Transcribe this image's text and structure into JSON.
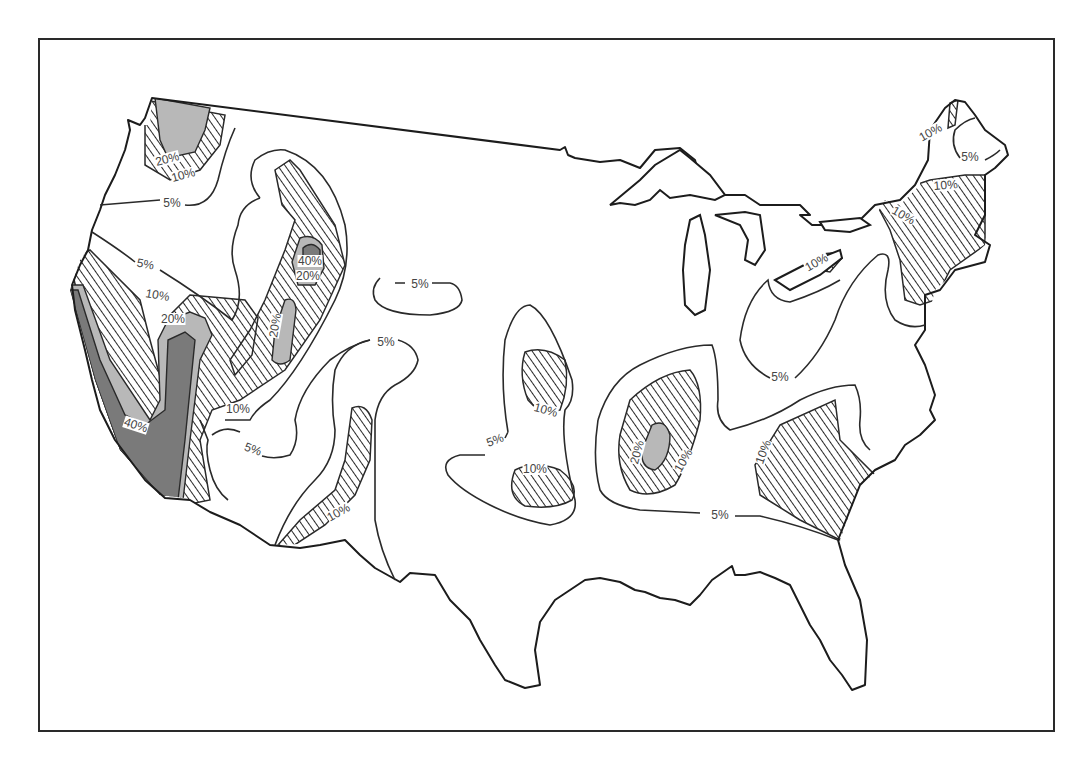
{
  "map": {
    "region": "Contiguous United States",
    "colors": {
      "outline": "#1c1c1c",
      "hatch": "#2a2a2a",
      "light_grey": "#b8b8b8",
      "dark_grey": "#7a7a7a",
      "background": "#ffffff"
    },
    "legend_implied": [
      {
        "range": "< 10%",
        "fill": "white"
      },
      {
        "range": "10% - 20%",
        "fill": "diagonal hatching"
      },
      {
        "range": "20% - 40%",
        "fill": "light grey"
      },
      {
        "range": ">= 40%",
        "fill": "dark grey"
      }
    ],
    "contour_labels": [
      {
        "id": "wa-20",
        "text": "20%",
        "x": 168,
        "y": 162,
        "rot": -15
      },
      {
        "id": "wa-10",
        "text": "10%",
        "x": 184,
        "y": 178,
        "rot": -15
      },
      {
        "id": "or-5",
        "text": "5%",
        "x": 172,
        "y": 206,
        "rot": 0
      },
      {
        "id": "ca-n-5",
        "text": "5%",
        "x": 145,
        "y": 267,
        "rot": 10
      },
      {
        "id": "ca-10",
        "text": "10%",
        "x": 157,
        "y": 298,
        "rot": 10
      },
      {
        "id": "ca-20",
        "text": "20%",
        "x": 173,
        "y": 322,
        "rot": 0
      },
      {
        "id": "ca-40",
        "text": "40%",
        "x": 135,
        "y": 428,
        "rot": 18
      },
      {
        "id": "id-40",
        "text": "40%",
        "x": 310,
        "y": 264,
        "rot": 0
      },
      {
        "id": "id-20",
        "text": "20%",
        "x": 308,
        "y": 279,
        "rot": 0
      },
      {
        "id": "ut-20",
        "text": "20%",
        "x": 278,
        "y": 326,
        "rot": -80
      },
      {
        "id": "nv-10",
        "text": "10%",
        "x": 238,
        "y": 412,
        "rot": 0
      },
      {
        "id": "az-5",
        "text": "5%",
        "x": 252,
        "y": 452,
        "rot": 20
      },
      {
        "id": "nm-10",
        "text": "10%",
        "x": 340,
        "y": 515,
        "rot": -30
      },
      {
        "id": "co-5",
        "text": "5%",
        "x": 386,
        "y": 345,
        "rot": 0
      },
      {
        "id": "ne-5",
        "text": "5%",
        "x": 420,
        "y": 287,
        "rot": 0
      },
      {
        "id": "ks-10",
        "text": "10%",
        "x": 545,
        "y": 413,
        "rot": 15
      },
      {
        "id": "ok-10",
        "text": "10%",
        "x": 535,
        "y": 472,
        "rot": 0
      },
      {
        "id": "ks-5",
        "text": "5%",
        "x": 496,
        "y": 443,
        "rot": -20
      },
      {
        "id": "ar-20",
        "text": "20%",
        "x": 640,
        "y": 453,
        "rot": -75
      },
      {
        "id": "ar-10",
        "text": "10%",
        "x": 686,
        "y": 462,
        "rot": -60
      },
      {
        "id": "south-5",
        "text": "5%",
        "x": 720,
        "y": 518,
        "rot": 0
      },
      {
        "id": "ga-10",
        "text": "10%",
        "x": 766,
        "y": 453,
        "rot": -70
      },
      {
        "id": "oh-5",
        "text": "5%",
        "x": 780,
        "y": 380,
        "rot": 0
      },
      {
        "id": "pa-10",
        "text": "10%",
        "x": 818,
        "y": 265,
        "rot": -30
      },
      {
        "id": "ny-10",
        "text": "10%",
        "x": 902,
        "y": 218,
        "rot": 30
      },
      {
        "id": "ne-10",
        "text": "10%",
        "x": 946,
        "y": 188,
        "rot": -5
      },
      {
        "id": "me-10",
        "text": "10%",
        "x": 932,
        "y": 135,
        "rot": -30
      },
      {
        "id": "me-5",
        "text": "5%",
        "x": 970,
        "y": 160,
        "rot": 0
      }
    ]
  }
}
